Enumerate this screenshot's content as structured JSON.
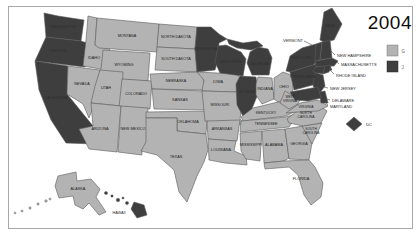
{
  "title": "2004",
  "legend": {
    "g_label": "G",
    "j_label": "J"
  },
  "colors": {
    "light": "#b3b3b3",
    "dark": "#3e3e3e",
    "border": "#5a5a5a",
    "label_light_state": "#1c1c1c",
    "label_dark_state": "#2e2e2e",
    "callout_text": "#2b2b2b",
    "callout_line": "#4a4a4a",
    "frame": "#a8a8a8",
    "title_color": "#0d0d0d",
    "background": "#ffffff"
  },
  "map": {
    "states": [
      {
        "id": "washington",
        "label": "WASHINGTON",
        "party": "j",
        "pts": "44,13 58,16 84,20 81,41 46,37",
        "lx": 63,
        "ly": 28
      },
      {
        "id": "oregon",
        "label": "OREGON",
        "party": "j",
        "pts": "46,37 81,41 90,44 85,67 35,61",
        "lx": 58,
        "ly": 52
      },
      {
        "id": "california",
        "label": "CALIFORNIA",
        "party": "j",
        "pts": "35,61 68,66 67,94 93,126 95,144 66,143 51,120 39,90",
        "lx": 56,
        "ly": 99
      },
      {
        "id": "idaho",
        "label": "IDAHO",
        "party": "g",
        "pts": "88,16 97,18 95,45 110,47 106,70 83,66 86,40",
        "lx": 94,
        "ly": 59
      },
      {
        "id": "montana",
        "label": "MONTANA",
        "party": "g",
        "pts": "97,18 159,24 157,52 99,48 95,45",
        "lx": 127,
        "ly": 37
      },
      {
        "id": "wyoming",
        "label": "WYOMING",
        "party": "g",
        "pts": "103,50 150,53 148,81 100,78",
        "lx": 124,
        "ly": 66
      },
      {
        "id": "nevada",
        "label": "NEVADA",
        "party": "g",
        "pts": "68,66 100,70 96,100 89,118 83,104 67,94",
        "lx": 82,
        "ly": 85
      },
      {
        "id": "utah",
        "label": "UTAH",
        "party": "g",
        "pts": "100,70 123,72 121,106 91,103 95,86",
        "lx": 106,
        "ly": 89
      },
      {
        "id": "colorado",
        "label": "COLORADO",
        "party": "g",
        "pts": "122,79 152,81 150,109 119,107",
        "lx": 136,
        "ly": 95
      },
      {
        "id": "arizona",
        "label": "ARIZONA",
        "party": "g",
        "pts": "91,103 121,106 117,152 89,149 79,129 93,126",
        "lx": 100,
        "ly": 130
      },
      {
        "id": "new-mexico",
        "label": "NEW MEXICO",
        "party": "g",
        "pts": "121,106 148,108 146,150 142,150 142,155 118,152",
        "lx": 133,
        "ly": 130
      },
      {
        "id": "north-dakota",
        "label": "NORTH DAKOTA",
        "party": "g",
        "pts": "159,24 197,27 195,49 157,47",
        "lx": 176,
        "ly": 38
      },
      {
        "id": "south-dakota",
        "label": "SOUTH DAKOTA",
        "party": "g",
        "pts": "157,47 195,49 197,72 155,70",
        "lx": 176,
        "ly": 60
      },
      {
        "id": "nebraska",
        "label": "NEBRASKA",
        "party": "g",
        "pts": "150,74 197,72 203,78 205,90 152,89",
        "lx": 176,
        "ly": 82
      },
      {
        "id": "kansas",
        "label": "KANSAS",
        "party": "g",
        "pts": "152,89 205,91 208,110 154,109",
        "lx": 180,
        "ly": 101
      },
      {
        "id": "oklahoma",
        "label": "OKLAHOMA",
        "party": "g",
        "pts": "146,112 208,111 206,134 177,131 177,118 146,118",
        "lx": 188,
        "ly": 123
      },
      {
        "id": "texas",
        "label": "TEXAS",
        "party": "g",
        "pts": "146,118 177,118 177,131 206,134 208,150 204,162 197,176 187,202 179,192 174,170 157,155 141,151 146,142",
        "lx": 176,
        "ly": 158
      },
      {
        "id": "minnesota",
        "label": "MINNESOTA",
        "party": "j",
        "pts": "197,27 211,27 219,34 227,39 219,43 218,60 215,70 197,72 195,49",
        "lx": 206,
        "ly": 50
      },
      {
        "id": "iowa",
        "label": "IOWA",
        "party": "g",
        "pts": "197,72 238,74 242,83 237,92 202,91 204,80",
        "lx": 218,
        "ly": 83
      },
      {
        "id": "missouri",
        "label": "MISSOURI",
        "party": "g",
        "pts": "202,91 237,92 243,100 240,119 246,125 205,121",
        "lx": 220,
        "ly": 106
      },
      {
        "id": "arkansas",
        "label": "ARKANSAS",
        "party": "g",
        "pts": "207,121 240,120 237,141 208,139",
        "lx": 222,
        "ly": 130
      },
      {
        "id": "louisiana",
        "label": "LOUISIANA",
        "party": "g",
        "pts": "208,139 236,141 234,151 246,156 247,165 225,163 209,160",
        "lx": 221,
        "ly": 151
      },
      {
        "id": "wisconsin",
        "label": "WISCONSIN",
        "party": "j",
        "pts": "218,46 226,45 241,52 246,59 243,76 220,73 215,62",
        "lx": 231,
        "ly": 63
      },
      {
        "id": "illinois",
        "label": "ILLINOIS",
        "party": "j",
        "pts": "240,76 256,77 258,94 251,111 244,118 237,105 236,84",
        "lx": 247,
        "ly": 93
      },
      {
        "id": "indiana",
        "label": "INDIANA",
        "party": "g",
        "pts": "258,77 272,78 274,99 262,104 256,95 256,84",
        "lx": 265,
        "ly": 90
      },
      {
        "id": "michigan-upper",
        "party": "j",
        "pts": "227,39 243,43 257,41 263,46 251,50 237,48 229,44"
      },
      {
        "id": "michigan",
        "label": "MICHIGAN",
        "party": "j",
        "pts": "250,52 258,47 268,49 272,58 269,75 252,75 247,63",
        "lx": 260,
        "ly": 65
      },
      {
        "id": "ohio",
        "label": "OHIO",
        "party": "g",
        "pts": "274,78 283,72 294,76 292,97 278,102 274,99",
        "lx": 284,
        "ly": 88
      },
      {
        "id": "kentucky",
        "label": "KENTUCKY",
        "party": "g",
        "pts": "241,117 253,108 278,102 298,104 302,108 286,116 243,121",
        "lx": 266,
        "ly": 114
      },
      {
        "id": "tennessee",
        "label": "TENNESSEE",
        "party": "g",
        "pts": "241,121 286,117 299,113 289,127 240,132",
        "lx": 266,
        "ly": 125
      },
      {
        "id": "mississippi",
        "label": "MISSISSIPPI",
        "party": "g",
        "pts": "240,133 262,131 260,161 246,159 241,151",
        "lx": 251,
        "ly": 146
      },
      {
        "id": "alabama",
        "label": "ALABAMA",
        "party": "g",
        "pts": "262,131 285,129 289,158 284,161 264,163",
        "lx": 274,
        "ly": 146
      },
      {
        "id": "georgia",
        "label": "GEORGIA",
        "party": "g",
        "pts": "285,129 303,126 312,143 309,160 289,159",
        "lx": 299,
        "ly": 145
      },
      {
        "id": "florida",
        "label": "FLORIDA",
        "party": "g",
        "pts": "264,163 284,161 309,160 315,167 323,183 321,197 311,205 304,195 298,175 289,167 265,169",
        "lx": 301,
        "ly": 180
      },
      {
        "id": "south-carolina",
        "label_lines": [
          "SOUTH",
          "CAROLINA"
        ],
        "party": "g",
        "pts": "302,126 322,123 312,144",
        "lx": 311,
        "ly": 132,
        "fs": 3.3
      },
      {
        "id": "north-carolina",
        "label_lines": [
          "NORTH",
          "CAROLINA"
        ],
        "party": "g",
        "pts": "287,119 297,111 317,104 327,111 321,123 303,126 289,123",
        "lx": 306,
        "ly": 116,
        "fs": 3.3
      },
      {
        "id": "virginia",
        "label": "VIRGINIA",
        "party": "g",
        "pts": "286,113 300,103 318,100 328,106 318,111 298,112",
        "lx": 306,
        "ly": 108,
        "fs": 3.4
      },
      {
        "id": "west-virginia",
        "label_lines": [
          "WEST",
          "VIRGINIA"
        ],
        "party": "g",
        "pts": "280,103 285,91 293,96 302,95 298,104 289,109",
        "lx": 290,
        "ly": 100,
        "fs": 3.2
      },
      {
        "id": "pennsylvania",
        "label": "PENNSYLVANIA",
        "party": "j",
        "pts": "290,72 316,64 320,83 294,90",
        "lx": 303,
        "ly": 78,
        "fs": 3.4
      },
      {
        "id": "new-york",
        "label": "NEW YORK",
        "party": "j",
        "pts": "286,71 290,56 302,48 316,44 318,61 313,65 290,72",
        "lx": 301,
        "ly": 59
      },
      {
        "id": "long-island",
        "party": "j",
        "pts": "318,68 330,66 332,70 319,72"
      },
      {
        "id": "new-jersey",
        "party": "j",
        "pts": "316,73 323,75 325,86 319,94 313,86 314,77"
      },
      {
        "id": "delaware",
        "party": "j",
        "pts": "319,92 325,91 328,103 321,103"
      },
      {
        "id": "maryland",
        "party": "j",
        "pts": "290,92 318,87 321,98 308,101 295,100"
      },
      {
        "id": "maine",
        "label": "MAINE",
        "party": "j",
        "pts": "320,40 324,12 332,8 342,24 334,40 324,42",
        "lx": 330,
        "ly": 27,
        "fs": 3.3
      },
      {
        "id": "vermont",
        "party": "j",
        "pts": "316,44 322,42 320,60 315,61"
      },
      {
        "id": "new-hampshire",
        "party": "j",
        "pts": "322,42 330,40 332,58 320,60"
      },
      {
        "id": "massachusetts",
        "party": "j",
        "pts": "315,61 332,58 338,61 334,66 316,67"
      },
      {
        "id": "connecticut",
        "party": "j",
        "pts": "315,67 325,66 323,74 313,72"
      },
      {
        "id": "rhode-island",
        "party": "j",
        "pts": "325,66 331,65 329,72 323,74"
      },
      {
        "id": "alaska",
        "label": "ALASKA",
        "party": "g",
        "pts": "58,176 76,172 77,181 91,179 100,189 96,197 106,212 99,215 89,203 83,209 75,205 73,196 59,198 55,186",
        "lx": 78,
        "ly": 190
      },
      {
        "id": "hawaii",
        "label": "HAWAII",
        "party": "j",
        "pts": "134,202 144,205 147,215 137,218 131,209",
        "lx": 119,
        "ly": 214
      }
    ],
    "islands": [
      {
        "id": "aleutian-1",
        "party": "g",
        "cx": 50,
        "cy": 199,
        "r": 1.1
      },
      {
        "id": "aleutian-2",
        "party": "g",
        "cx": 46,
        "cy": 201,
        "r": 1.3
      },
      {
        "id": "aleutian-3",
        "party": "g",
        "cx": 38,
        "cy": 204,
        "r": 1.2
      },
      {
        "id": "aleutian-4",
        "party": "g",
        "cx": 30,
        "cy": 208,
        "r": 1.2
      },
      {
        "id": "aleutian-5",
        "party": "g",
        "cx": 22,
        "cy": 211,
        "r": 1.1
      },
      {
        "id": "aleutian-6",
        "party": "g",
        "cx": 15,
        "cy": 213,
        "r": 1.0
      },
      {
        "id": "hawaii-island-1",
        "party": "j",
        "cx": 106,
        "cy": 193,
        "r": 1.6
      },
      {
        "id": "hawaii-island-2",
        "party": "j",
        "cx": 112,
        "cy": 196,
        "r": 1.2
      },
      {
        "id": "hawaii-island-3",
        "party": "j",
        "cx": 118,
        "cy": 200,
        "r": 1.8
      },
      {
        "id": "hawaii-island-4",
        "party": "j",
        "cx": 123,
        "cy": 198,
        "r": 1.1
      },
      {
        "id": "hawaii-island-5",
        "party": "j",
        "cx": 127,
        "cy": 203,
        "r": 1.6
      }
    ],
    "callouts": [
      {
        "id": "vermont",
        "label": "VERMONT",
        "x": 303,
        "y": 42,
        "anchor": "end",
        "line": [
          304,
          41,
          312,
          45
        ]
      },
      {
        "id": "new-hampshire",
        "label": "NEW HAMPSHIRE",
        "x": 337,
        "y": 57,
        "line": [
          331,
          51,
          335,
          55
        ]
      },
      {
        "id": "massachusetts",
        "label": "MASSACHUSETTS",
        "x": 341,
        "y": 66,
        "line": [
          337,
          62,
          339,
          64
        ]
      },
      {
        "id": "rhode-island",
        "label": "RHODE ISLAND",
        "x": 336,
        "y": 77,
        "line": [
          330,
          70,
          334,
          74
        ]
      },
      {
        "id": "new-jersey",
        "label": "NEW JERSEY",
        "x": 330,
        "y": 90,
        "line": [
          324,
          87,
          328,
          88
        ]
      },
      {
        "id": "delaware",
        "label": "DELAWARE",
        "x": 332,
        "y": 102,
        "line": [
          327,
          99,
          330,
          100
        ]
      },
      {
        "id": "maryland",
        "label": "MARYLAND",
        "x": 330,
        "y": 108,
        "line": [
          321,
          99,
          328,
          105
        ]
      }
    ],
    "dc": {
      "label": "DC",
      "pts": "354,117 362,124 354,131 346,124",
      "lx": 366,
      "ly": 126
    }
  }
}
